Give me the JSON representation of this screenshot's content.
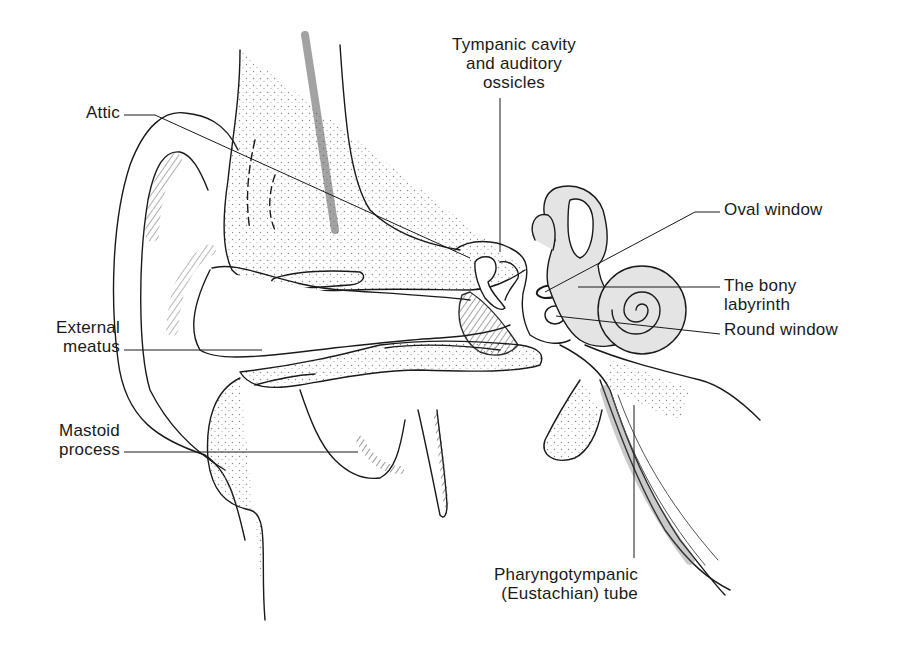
{
  "figure": {
    "colors": {
      "line": "#1a1a1a",
      "stipple": "#9a9a9a",
      "labyrinth_fill": "#e4e4e4",
      "background": "#ffffff"
    }
  },
  "labels": {
    "tympanic": {
      "line1": "Tympanic cavity",
      "line2": "and auditory",
      "line3": "ossicles"
    },
    "attic": {
      "line1": "Attic"
    },
    "oval_window": {
      "line1": "Oval window"
    },
    "bony_labyrinth": {
      "line1": "The bony",
      "line2": "labyrinth"
    },
    "round_window": {
      "line1": "Round window"
    },
    "external_meatus": {
      "line1": "External",
      "line2": "meatus"
    },
    "mastoid": {
      "line1": "Mastoid",
      "line2": "process"
    },
    "eustachian": {
      "line1": "Pharyngotympanic",
      "line2": "(Eustachian) tube"
    }
  }
}
